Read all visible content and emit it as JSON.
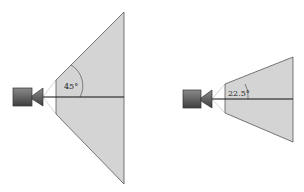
{
  "diagram": {
    "left": {
      "fov_label": "45°",
      "fov_degrees": 45
    },
    "right": {
      "fov_label": "22.5°",
      "fov_degrees": 22.5
    },
    "colors": {
      "frustum_fill": "#d4d4d4",
      "frustum_edge": "#555555",
      "camera_body": "#555555",
      "axis_line": "#111111",
      "guide_line": "#bbbbbb"
    }
  }
}
